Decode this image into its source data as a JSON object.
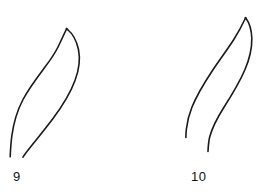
{
  "page": {
    "background_color": "#ffffff",
    "ink_color": "#1a1a1a",
    "width": 271,
    "height": 195
  },
  "figures": [
    {
      "id": "figure-9",
      "caption": "9",
      "shape": "closed leaf outline with pointed apex and notched tip",
      "ink_color": "#1a1a1a",
      "stroke_width": 1.6,
      "outer_path": "M 67.5 29.5 C 72.5 33.5 76.5 40.5 78.5 49.5 C 80.5 59.5 79.0 70.0 75.0 80.5 C 70.0 94.0 62.0 106.5 53.0 118.5 C 44.0 130.5 34.5 142.0 26.2 152.5 C 24.6 154.6 23.6 156.0 23.0 157.2",
      "inner_path": "M 66.6 28.8 C 64.0 34.0 61.0 41.0 58.0 47.0 C 54.5 54.0 50.0 60.5 45.0 67.0 C 37.5 77.0 29.0 88.0 23.0 99.5 C 17.0 111.0 13.5 123.5 11.8 136.0 C 10.9 142.8 10.5 149.5 10.2 156.8",
      "tip_path": "M 66.6 28.8 C 66.2 28.3 66.8 28.0 67.5 29.5"
    },
    {
      "id": "figure-10",
      "caption": "10",
      "shape": "open two-stroke leaf outline with sharp apex, strokes diverging downward",
      "ink_color": "#1a1a1a",
      "stroke_width": 1.6,
      "outer_path": "M 245.8 18.0 C 249.5 23.0 251.6 30.0 251.8 38.5 C 252.0 48.5 249.5 59.0 245.0 69.5 C 239.5 82.5 231.5 95.5 223.5 108.0 C 217.5 117.5 212.5 127.0 209.8 136.5 C 208.9 140.0 208.3 145.0 208.0 151.5",
      "inner_path": "M 245.3 18.5 C 242.0 25.5 238.0 33.0 233.5 40.0 C 227.0 50.0 219.5 60.0 212.5 70.5 C 204.5 82.5 197.0 95.0 192.0 107.0 C 189.0 114.5 187.2 122.0 186.4 129.0 C 186.0 132.0 185.9 134.5 185.9 137.5",
      "tip_path": "M 245.3 18.5 C 245.2 17.6 245.4 17.4 245.8 18.0"
    }
  ]
}
